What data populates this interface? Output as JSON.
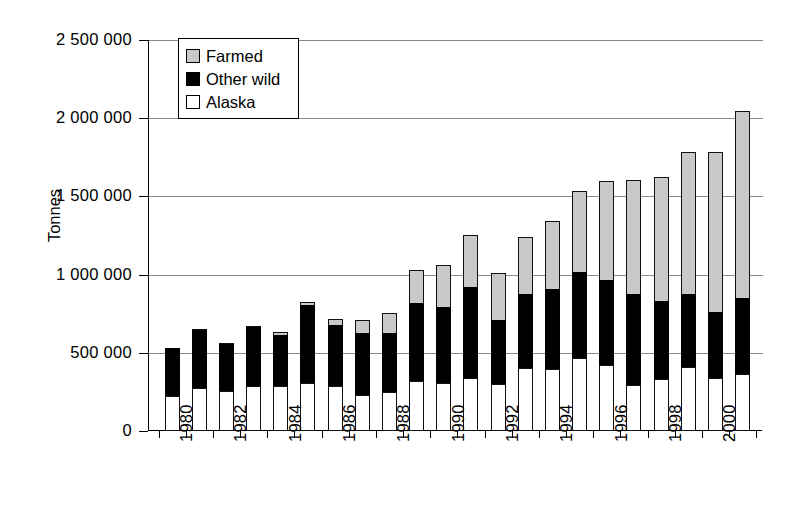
{
  "chart_data": {
    "type": "bar",
    "subtype": "stacked-bar",
    "title": "",
    "xlabel": "",
    "ylabel": "Tonnes",
    "ylim": [
      0,
      2500000
    ],
    "ytick_values": [
      0,
      500000,
      1000000,
      1500000,
      2000000,
      2500000
    ],
    "ytick_labels": [
      "0",
      "500 000",
      "1 000 000",
      "1 500 000",
      "2 000 000",
      "2 500 000"
    ],
    "grid": true,
    "grid_axis": "y",
    "legend_position": "upper-left-inside",
    "categories": [
      1980,
      1981,
      1982,
      1983,
      1984,
      1985,
      1986,
      1987,
      1988,
      1989,
      1990,
      1991,
      1992,
      1993,
      1994,
      1995,
      1996,
      1997,
      1998,
      1999,
      2000,
      2001
    ],
    "xtick_labels": [
      "1980",
      "",
      "1982",
      "",
      "1984",
      "",
      "1986",
      "",
      "1988",
      "",
      "1990",
      "",
      "1992",
      "",
      "1994",
      "",
      "1996",
      "",
      "1998",
      "",
      "2000",
      ""
    ],
    "series": [
      {
        "name": "Alaska",
        "color": "#ffffff",
        "values": [
          225000,
          275000,
          255000,
          285000,
          285000,
          305000,
          285000,
          230000,
          250000,
          320000,
          310000,
          340000,
          300000,
          400000,
          395000,
          465000,
          420000,
          295000,
          330000,
          410000,
          340000,
          365000
        ]
      },
      {
        "name": "Other wild",
        "color": "#000000",
        "values": [
          315000,
          375000,
          305000,
          385000,
          335000,
          510000,
          400000,
          405000,
          380000,
          505000,
          490000,
          590000,
          415000,
          485000,
          520000,
          555000,
          555000,
          585000,
          510000,
          475000,
          425000,
          490000
        ]
      },
      {
        "name": "Farmed",
        "color": "#c9c9c9",
        "values": [
          0,
          5000,
          15000,
          15000,
          25000,
          20000,
          45000,
          85000,
          140000,
          215000,
          275000,
          335000,
          310000,
          370000,
          440000,
          530000,
          635000,
          740000,
          800000,
          910000,
          1035000,
          1205000
        ]
      }
    ],
    "totals": [
      540000,
      655000,
      575000,
      685000,
      645000,
      835000,
      730000,
      720000,
      770000,
      1040000,
      1075000,
      1265000,
      1025000,
      1255000,
      1355000,
      1550000,
      1610000,
      1620000,
      1640000,
      1795000,
      1800000,
      2060000
    ]
  },
  "legend": {
    "items": [
      {
        "label": "Farmed",
        "swatch": "farmed"
      },
      {
        "label": "Other wild",
        "swatch": "wild"
      },
      {
        "label": "Alaska",
        "swatch": "alaska"
      }
    ]
  },
  "colors": {
    "farmed": "#c9c9c9",
    "other_wild": "#000000",
    "alaska": "#ffffff",
    "axis": "#000000",
    "gridline": "#8a8a8a"
  }
}
